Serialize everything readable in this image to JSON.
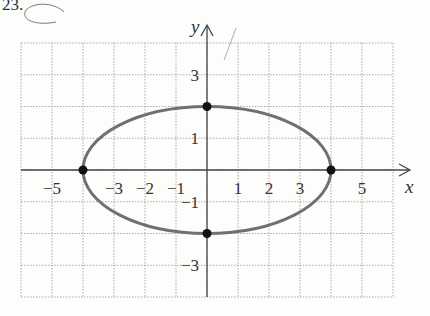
{
  "problem_label": "23.",
  "chart_data": {
    "type": "line",
    "title": "",
    "xlabel": "x",
    "ylabel": "y",
    "xlim": [
      -6,
      6
    ],
    "ylim": [
      -4,
      4
    ],
    "grid": true,
    "x_tick_labels": [
      "-5",
      "-3",
      "-2",
      "-1",
      "1",
      "2",
      "3",
      "5"
    ],
    "x_ticks": [
      -5,
      -3,
      -2,
      -1,
      1,
      2,
      3,
      5
    ],
    "y_tick_labels": [
      "3",
      "1",
      "-1",
      "-3"
    ],
    "y_ticks": [
      3,
      1,
      -1,
      -3
    ],
    "series": [
      {
        "name": "ellipse",
        "shape": "ellipse",
        "center": [
          0,
          0
        ],
        "semi_major_x": 4,
        "semi_minor_y": 2,
        "equation": "x^2/16 + y^2/4 = 1",
        "color": "#707070"
      }
    ],
    "points": [
      {
        "x": -4,
        "y": 0
      },
      {
        "x": 4,
        "y": 0
      },
      {
        "x": 0,
        "y": 2
      },
      {
        "x": 0,
        "y": -2
      }
    ]
  }
}
